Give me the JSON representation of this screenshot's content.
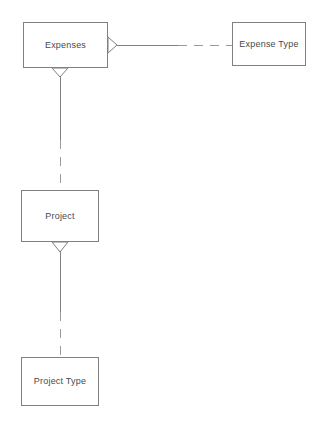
{
  "diagram": {
    "type": "entity-relationship-diagram",
    "notation": "crows-foot",
    "background_color": "#ffffff",
    "line_color": "#808080",
    "text_color": "#4a4a4a",
    "entities": [
      {
        "id": "expenses",
        "label": "Expenses",
        "x": 23,
        "y": 22,
        "width": 85,
        "height": 46
      },
      {
        "id": "expense_type",
        "label": "Expense Type",
        "x": 232,
        "y": 22,
        "width": 74,
        "height": 44
      },
      {
        "id": "project",
        "label": "Project",
        "x": 21,
        "y": 190,
        "width": 78,
        "height": 52
      },
      {
        "id": "project_type",
        "label": "Project Type",
        "x": 21,
        "y": 357,
        "width": 78,
        "height": 49
      }
    ],
    "relationships": [
      {
        "id": "expenses-to-expense-type",
        "from": "expenses",
        "to": "expense_type",
        "from_cardinality": "many",
        "to_cardinality": "one",
        "orientation": "horizontal",
        "line_style": "solid-then-dashed"
      },
      {
        "id": "expenses-to-project",
        "from": "expenses",
        "to": "project",
        "from_cardinality": "many",
        "to_cardinality": "one",
        "orientation": "vertical",
        "line_style": "solid-then-dashed"
      },
      {
        "id": "project-to-project-type",
        "from": "project",
        "to": "project_type",
        "from_cardinality": "many",
        "to_cardinality": "one",
        "orientation": "vertical",
        "line_style": "solid-then-dashed"
      }
    ]
  }
}
